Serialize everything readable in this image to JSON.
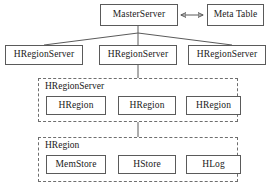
{
  "diagram": {
    "type": "block-hierarchy",
    "colors": {
      "stroke": "#5a5a5a",
      "dashed_stroke": "#6e6e6e",
      "text": "#1a1a1a",
      "background": "#ffffff"
    }
  },
  "master": {
    "label": "MasterServer"
  },
  "meta": {
    "label": "Meta Table"
  },
  "region_servers": [
    {
      "label": "HRegionServer"
    },
    {
      "label": "HRegionServer"
    },
    {
      "label": "HRegionServer"
    }
  ],
  "region_server_group": {
    "label": "HRegionServer",
    "children": [
      {
        "label": "HRegion"
      },
      {
        "label": "HRegion"
      },
      {
        "label": "HRegion"
      }
    ]
  },
  "region_group": {
    "label": "HRegion",
    "children": [
      {
        "label": "MemStore"
      },
      {
        "label": "HStore"
      },
      {
        "label": "HLog"
      }
    ]
  },
  "connectors": {
    "master_meta": "double-headed-arrow",
    "master_to_servers": "fan-out-lines",
    "server_to_group": "vertical-line",
    "group_to_group": "vertical-line"
  }
}
